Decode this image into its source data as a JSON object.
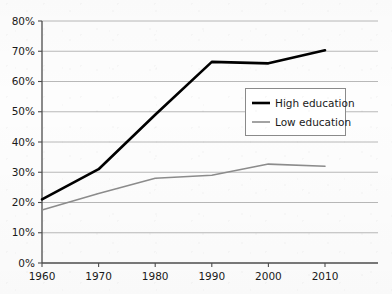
{
  "chart_data": {
    "type": "line",
    "title": "",
    "subtitle": "",
    "xlabel": "",
    "ylabel": "",
    "x": [
      1960,
      1970,
      1980,
      1990,
      2000,
      2010
    ],
    "categories": [
      "1960",
      "1970",
      "1980",
      "1990",
      "2000",
      "2010"
    ],
    "series": [
      {
        "name": "High education",
        "color": "#000000",
        "line_width": 2.6,
        "values": [
          21,
          31,
          49,
          66.5,
          66,
          70.3
        ]
      },
      {
        "name": "Low education",
        "color": "#8c8c8c",
        "line_width": 1.6,
        "values": [
          17.5,
          23,
          28,
          29,
          32.7,
          32
        ]
      }
    ],
    "xlim": [
      1960,
      2010
    ],
    "ylim": [
      0,
      80
    ],
    "y_tick_step": 10,
    "y_tick_labels": [
      "0%",
      "10%",
      "20%",
      "30%",
      "40%",
      "50%",
      "60%",
      "70%",
      "80%"
    ],
    "y_tick_values": [
      0,
      10,
      20,
      30,
      40,
      50,
      60,
      70,
      80
    ],
    "x_tick_labels": [
      "1960",
      "1970",
      "1980",
      "1990",
      "2000",
      "2010"
    ],
    "grid": {
      "horizontal": true,
      "vertical": false,
      "color": "#b0b0b0"
    },
    "legend": {
      "position": "inside-right",
      "border_color": "#8a8a8a",
      "background": "#ffffff",
      "entries": [
        {
          "label": "High education",
          "color": "#000000",
          "line_width": 2.6
        },
        {
          "label": "Low education",
          "color": "#8c8c8c",
          "line_width": 1.6
        }
      ]
    },
    "axis": {
      "color": "#4d4d4d",
      "x_axis_visible": true,
      "y_axis_visible": true
    }
  }
}
